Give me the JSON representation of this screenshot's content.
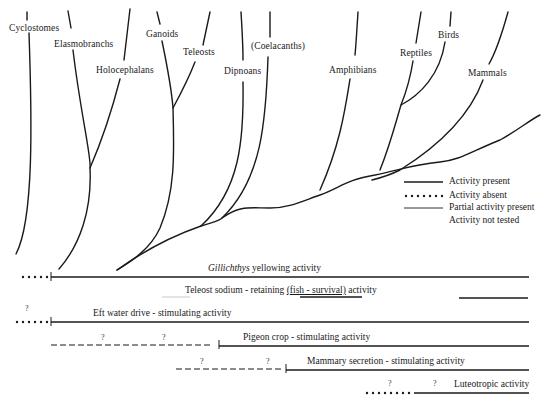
{
  "taxa": [
    {
      "id": "cyclostomes",
      "label": "Cyclostomes"
    },
    {
      "id": "elasmobranchs",
      "label": "Elasmobranchs"
    },
    {
      "id": "holocephalans",
      "label": "Holocephalans"
    },
    {
      "id": "ganoids",
      "label": "Ganoids"
    },
    {
      "id": "teleosts",
      "label": "Teleosts"
    },
    {
      "id": "dipnoans",
      "label": "Dipnoans"
    },
    {
      "id": "coelacanths",
      "label": "(Coelacanths)"
    },
    {
      "id": "amphibians",
      "label": "Amphibians"
    },
    {
      "id": "reptiles",
      "label": "Reptiles"
    },
    {
      "id": "birds",
      "label": "Birds"
    },
    {
      "id": "mammals",
      "label": "Mammals"
    }
  ],
  "legend": {
    "items": [
      {
        "style": "solid",
        "label": "Activity present"
      },
      {
        "style": "dotted",
        "label": "Activity absent"
      },
      {
        "style": "thin",
        "label": "Partial activity present"
      },
      {
        "style": "none",
        "label": "Activity not tested"
      }
    ]
  },
  "activities": [
    {
      "id": "gillichthys",
      "label_italic": "Gillichthys",
      "label": " yellowing activity"
    },
    {
      "id": "teleost-sodium",
      "label_pre": "Teleost sodium - retaining ",
      "label_underlined": "(fish - survival)",
      "label_post": " activity"
    },
    {
      "id": "eft-water",
      "label": "Eft water drive - stimulating activity",
      "question_marks": [
        "?"
      ]
    },
    {
      "id": "pigeon-crop",
      "label": "Pigeon crop - stimulating activity",
      "question_marks": [
        "?",
        "?"
      ]
    },
    {
      "id": "mammary",
      "label": "Mammary secretion - stimulating activity",
      "question_marks": [
        "?",
        "?"
      ]
    },
    {
      "id": "luteotropic",
      "label": "Luteotropic activity",
      "question_marks": [
        "?",
        "?"
      ]
    }
  ]
}
